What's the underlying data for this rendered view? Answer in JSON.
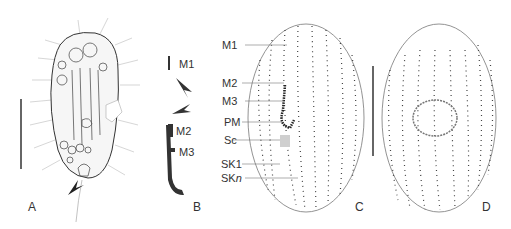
{
  "panels": {
    "A": {
      "label": "A"
    },
    "B": {
      "label": "B",
      "labels": [
        "M1",
        "M2",
        "M3"
      ]
    },
    "C": {
      "label": "C",
      "labels": [
        "M1",
        "M2",
        "M3",
        "PM",
        "Sc",
        "SK1",
        "SKn_base",
        "SKn_sub"
      ]
    },
    "D": {
      "label": "D"
    }
  },
  "b_labels": {
    "m1": "M1",
    "m2": "M2",
    "m3": "M3"
  },
  "c_labels": {
    "m1": "M1",
    "m2": "M2",
    "m3": "M3",
    "pm": "PM",
    "sc": "Sc",
    "sk1": "SK1",
    "skn": "SK",
    "skn_sub": "n"
  },
  "colors": {
    "line": "#555555",
    "dot": "#333333",
    "scutica": "#cfcfcf"
  }
}
